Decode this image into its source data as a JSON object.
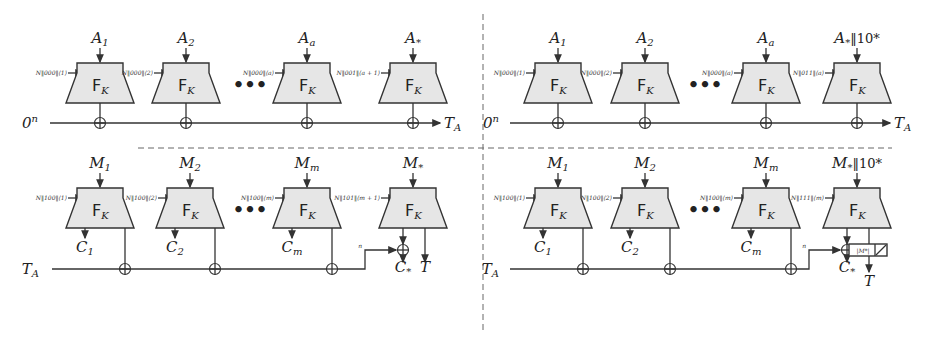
{
  "figure": {
    "block_label": "F",
    "block_label_sub": "K",
    "ellipsis": "•••",
    "panels": [
      {
        "id": "top-left",
        "start_label": "0",
        "start_label_sup": "n",
        "end_label": "T",
        "end_label_sub": "A",
        "blocks": [
          {
            "input": "A",
            "input_sub": "1",
            "input_suffix": "",
            "nonce": "N‖000‖⟨1⟩"
          },
          {
            "input": "A",
            "input_sub": "2",
            "input_suffix": "",
            "nonce": "N‖000‖⟨2⟩"
          },
          {
            "input": "A",
            "input_sub": "a",
            "input_suffix": "",
            "nonce": "N‖000‖⟨a⟩"
          },
          {
            "input": "A",
            "input_sub": "*",
            "input_suffix": "",
            "nonce": "N‖001‖⟨a + 1⟩"
          }
        ]
      },
      {
        "id": "top-right",
        "start_label": "0",
        "start_label_sup": "n",
        "end_label": "T",
        "end_label_sub": "A",
        "blocks": [
          {
            "input": "A",
            "input_sub": "1",
            "input_suffix": "",
            "nonce": "N‖000‖⟨1⟩"
          },
          {
            "input": "A",
            "input_sub": "2",
            "input_suffix": "",
            "nonce": "N‖000‖⟨2⟩"
          },
          {
            "input": "A",
            "input_sub": "a",
            "input_suffix": "",
            "nonce": "N‖000‖⟨a⟩"
          },
          {
            "input": "A",
            "input_sub": "*",
            "input_suffix": "‖10*",
            "nonce": "N‖011‖⟨a⟩"
          }
        ]
      },
      {
        "id": "bottom-left",
        "start_label": "T",
        "start_label_sub": "A",
        "tag_label": "T",
        "final_label": "C",
        "final_label_sub": "*",
        "wire_label": "n",
        "blocks": [
          {
            "input": "M",
            "input_sub": "1",
            "input_suffix": "",
            "nonce": "N‖100‖⟨1⟩",
            "out": "C",
            "out_sub": "1"
          },
          {
            "input": "M",
            "input_sub": "2",
            "input_suffix": "",
            "nonce": "N‖100‖⟨2⟩",
            "out": "C",
            "out_sub": "2"
          },
          {
            "input": "M",
            "input_sub": "m",
            "input_suffix": "",
            "nonce": "N‖100‖⟨m⟩",
            "out": "C",
            "out_sub": "m"
          },
          {
            "input": "M",
            "input_sub": "*",
            "input_suffix": "",
            "nonce": "N‖101‖⟨m + 1⟩"
          }
        ]
      },
      {
        "id": "bottom-right",
        "start_label": "T",
        "start_label_sub": "A",
        "tag_label": "T",
        "final_label": "C",
        "final_label_sub": "*",
        "wire_label": "n",
        "truncate_label": "|M*|",
        "blocks": [
          {
            "input": "M",
            "input_sub": "1",
            "input_suffix": "",
            "nonce": "N‖100‖⟨1⟩",
            "out": "C",
            "out_sub": "1"
          },
          {
            "input": "M",
            "input_sub": "2",
            "input_suffix": "",
            "nonce": "N‖100‖⟨2⟩",
            "out": "C",
            "out_sub": "2"
          },
          {
            "input": "M",
            "input_sub": "m",
            "input_suffix": "",
            "nonce": "N‖100‖⟨m⟩",
            "out": "C",
            "out_sub": "m"
          },
          {
            "input": "M",
            "input_sub": "*",
            "input_suffix": "‖10*",
            "nonce": "N‖111‖⟨m⟩"
          }
        ]
      }
    ]
  }
}
